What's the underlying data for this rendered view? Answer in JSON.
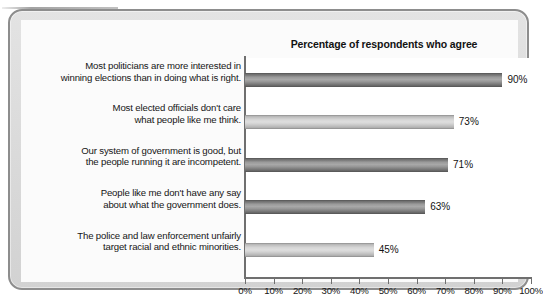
{
  "figure": {
    "title": "Percentage of respondents who agree"
  },
  "chart_data": {
    "type": "bar",
    "orientation": "horizontal",
    "title": "Percentage of respondents who agree",
    "xlabel": "",
    "ylabel": "",
    "xlim": [
      0,
      100
    ],
    "grid": false,
    "legend": null,
    "categories": [
      "Most politicians are more interested in winning elections than in doing what is right.",
      "Most elected officials don't care what people like me think.",
      "Our system of government is good, but the people running it are incompetent.",
      "People like me don't have any say about what the government does.",
      "The police and law enforcement unfairly target racial and ethnic minorities."
    ],
    "category_lines": [
      [
        "Most politicians are more interested in",
        "winning elections than in doing what is right."
      ],
      [
        "Most elected officials don't care",
        "what people like me think."
      ],
      [
        "Our system of government is good, but",
        "the people running it are incompetent."
      ],
      [
        "People like me don't have any say",
        "about what the government does."
      ],
      [
        "The police and law enforcement unfairly",
        "target racial and ethnic minorities."
      ]
    ],
    "values": [
      90,
      73,
      71,
      63,
      45
    ],
    "value_labels": [
      "90%",
      "73%",
      "71%",
      "63%",
      "45%"
    ],
    "bar_styles": [
      "dark",
      "light",
      "dark",
      "dark",
      "light"
    ],
    "xticks": [
      0,
      10,
      20,
      30,
      40,
      50,
      60,
      70,
      80,
      90,
      100
    ],
    "xtick_labels": [
      "0%",
      "10%",
      "20%",
      "30%",
      "40%",
      "50%",
      "60%",
      "70%",
      "80%",
      "90%",
      "100%"
    ]
  },
  "colors": {
    "bar_dark": "#8a8a8a",
    "bar_light": "#c6c6c6",
    "axis": "#6f6f6f",
    "frame_border": "#8d8d8d",
    "frame_fill": "#dcdcdc",
    "plot_background": "#ffffff",
    "text": "#151515"
  }
}
